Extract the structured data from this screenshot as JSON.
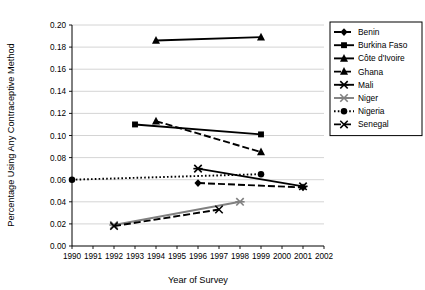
{
  "chart_data": {
    "type": "line",
    "title": "",
    "xlabel": "Year of Survey",
    "ylabel": "Percentage Using Any Contraceptive Method",
    "xlim": [
      1990,
      2002
    ],
    "ylim": [
      0.0,
      0.2
    ],
    "xticks": [
      "1990",
      "1991",
      "1992",
      "1993",
      "1994",
      "1995",
      "1996",
      "1997",
      "1998",
      "1999",
      "2000",
      "2001",
      "2002"
    ],
    "yticks": [
      "0.00",
      "0.02",
      "0.04",
      "0.06",
      "0.08",
      "0.10",
      "0.12",
      "0.14",
      "0.16",
      "0.18",
      "0.20"
    ],
    "grid": "horizontal",
    "legend_position": "right",
    "series": [
      {
        "name": "Benin",
        "marker": "diamond",
        "line": "dashed",
        "color": "#000000",
        "points": [
          {
            "x": 1996,
            "y": 0.057
          },
          {
            "x": 2001,
            "y": 0.053
          }
        ]
      },
      {
        "name": "Burkina Faso",
        "marker": "square",
        "line": "solid",
        "color": "#000000",
        "points": [
          {
            "x": 1993,
            "y": 0.11
          },
          {
            "x": 1999,
            "y": 0.101
          }
        ]
      },
      {
        "name": "Côte d'Ivoire",
        "marker": "triangle",
        "line": "solid",
        "color": "#000000",
        "points": [
          {
            "x": 1994,
            "y": 0.186
          },
          {
            "x": 1999,
            "y": 0.189
          }
        ]
      },
      {
        "name": "Ghana",
        "marker": "triangle",
        "line": "dashed",
        "color": "#000000",
        "points": [
          {
            "x": 1994,
            "y": 0.113
          },
          {
            "x": 1999,
            "y": 0.085
          }
        ]
      },
      {
        "name": "Mali",
        "marker": "star",
        "line": "solid",
        "color": "#000000",
        "points": [
          {
            "x": 1996,
            "y": 0.07
          },
          {
            "x": 2001,
            "y": 0.054
          }
        ]
      },
      {
        "name": "Niger",
        "marker": "star",
        "line": "solid",
        "color": "#808080",
        "points": [
          {
            "x": 1992,
            "y": 0.019
          },
          {
            "x": 1998,
            "y": 0.04
          }
        ]
      },
      {
        "name": "Nigeria",
        "marker": "circle",
        "line": "dotted",
        "color": "#000000",
        "points": [
          {
            "x": 1990,
            "y": 0.06
          },
          {
            "x": 1999,
            "y": 0.065
          }
        ]
      },
      {
        "name": "Senegal",
        "marker": "cross",
        "line": "dashed",
        "color": "#000000",
        "points": [
          {
            "x": 1992,
            "y": 0.018
          },
          {
            "x": 1997,
            "y": 0.033
          }
        ]
      }
    ]
  }
}
